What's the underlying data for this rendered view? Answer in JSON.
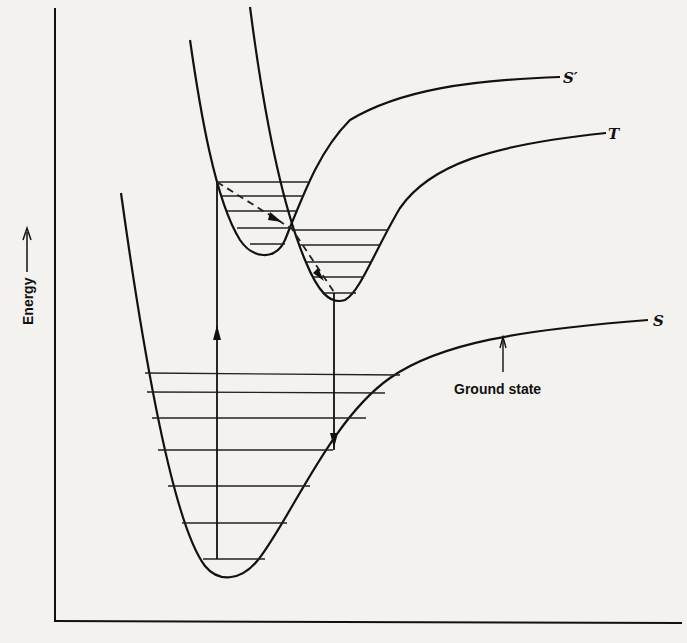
{
  "diagram": {
    "title": "",
    "y_axis_label": "Energy",
    "x_axis_label": "",
    "curves": [
      {
        "id": "ground",
        "label": "S",
        "annotation": "Ground state"
      },
      {
        "id": "singlet_excited",
        "label": "S′"
      },
      {
        "id": "triplet",
        "label": "T"
      }
    ],
    "transitions": [
      {
        "type": "absorption",
        "from": "S",
        "to": "S′",
        "style": "solid arrow up"
      },
      {
        "type": "intersystem_crossing",
        "from": "S′",
        "to": "T",
        "style": "dashed arrow"
      },
      {
        "type": "phosphorescence",
        "from": "T",
        "to": "S",
        "style": "solid arrow down"
      }
    ],
    "vibrational_levels": {
      "S": 7,
      "S′": 5,
      "T": 5
    }
  },
  "colors": {
    "ink": "#111111",
    "paper": "#f3f2ee"
  }
}
